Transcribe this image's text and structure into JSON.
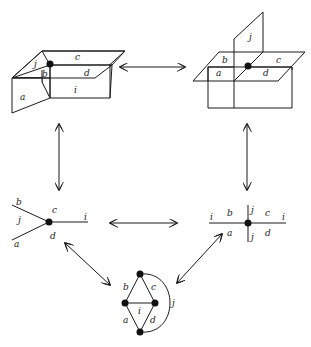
{
  "diagram": {
    "title": "",
    "panels": {
      "box_top_left": {
        "description": "3D box with folded flap at a vertex",
        "labels": {
          "a": "a",
          "b": "b",
          "c": "c",
          "d": "d",
          "i": "i",
          "j": "j"
        }
      },
      "box_top_right": {
        "description": "Two planes crossing with a vertical sheet j",
        "labels": {
          "a": "a",
          "b": "b",
          "c": "c",
          "d": "d",
          "j": "j"
        }
      },
      "vertex_mid_left": {
        "description": "Trivalent vertex with edges b, a, i",
        "labels": {
          "b": "b",
          "j": "j",
          "c": "c",
          "i": "i",
          "a": "a",
          "d": "d"
        }
      },
      "vertex_mid_right": {
        "description": "Four-valent crossing vertex",
        "labels": {
          "i_left": "i",
          "b": "b",
          "j_top": "j",
          "c": "c",
          "i_right": "i",
          "a": "a",
          "j_bottom": "j",
          "d": "d"
        }
      },
      "graph_bottom": {
        "description": "Planar graph with four vertices and loop j",
        "labels": {
          "b": "b",
          "c": "c",
          "i": "i",
          "a": "a",
          "d": "d",
          "j": "j"
        }
      }
    },
    "arrows": [
      {
        "from": "box_top_left",
        "to": "box_top_right",
        "type": "double-headed"
      },
      {
        "from": "box_top_left",
        "to": "vertex_mid_left",
        "type": "double-headed"
      },
      {
        "from": "box_top_right",
        "to": "vertex_mid_right",
        "type": "double-headed"
      },
      {
        "from": "vertex_mid_left",
        "to": "vertex_mid_right",
        "type": "double-headed"
      },
      {
        "from": "vertex_mid_left",
        "to": "graph_bottom",
        "type": "double-headed"
      },
      {
        "from": "vertex_mid_right",
        "to": "graph_bottom",
        "type": "double-headed"
      }
    ]
  }
}
